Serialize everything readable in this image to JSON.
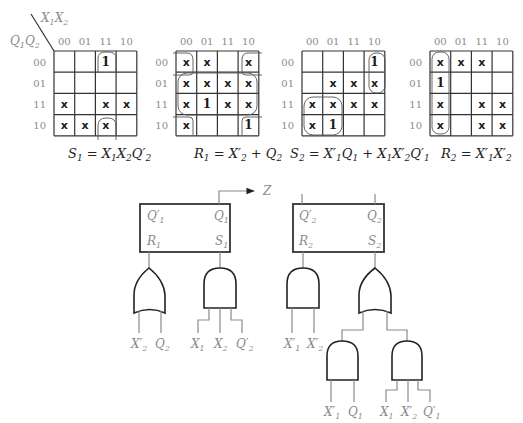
{
  "kmaps": [
    {
      "id": "S1",
      "corner_row_label": "Q1Q2",
      "corner_col_label": "X1X2",
      "col_headers": [
        "00",
        "01",
        "11",
        "10"
      ],
      "row_headers": [
        "00",
        "01",
        "11",
        "10"
      ],
      "cells": [
        [
          "",
          "",
          "1",
          ""
        ],
        [
          "",
          "",
          "",
          ""
        ],
        [
          "X",
          "",
          "X",
          "X"
        ],
        [
          "X",
          "X",
          "X",
          ""
        ]
      ],
      "equation": "S₁ = X₁X₂Q′₂"
    },
    {
      "id": "R1",
      "col_headers": [
        "00",
        "01",
        "11",
        "10"
      ],
      "row_headers": [
        "00",
        "01",
        "11",
        "10"
      ],
      "cells": [
        [
          "X",
          "X",
          "",
          "X"
        ],
        [
          "X",
          "X",
          "X",
          "X"
        ],
        [
          "X",
          "1",
          "X",
          "X"
        ],
        [
          "X",
          "",
          "",
          "1"
        ]
      ],
      "equation": "R₁ = X′₂ + Q₂"
    },
    {
      "id": "S2",
      "col_headers": [
        "00",
        "01",
        "11",
        "10"
      ],
      "row_headers": [
        "00",
        "01",
        "11",
        "10"
      ],
      "cells": [
        [
          "",
          "",
          "",
          "1"
        ],
        [
          "",
          "X",
          "X",
          "X"
        ],
        [
          "X",
          "X",
          "X",
          "X"
        ],
        [
          "X",
          "1",
          "",
          ""
        ]
      ],
      "equation": "S₂ = X′₁Q₁ + X₁X′₂Q′₁"
    },
    {
      "id": "R2",
      "col_headers": [
        "00",
        "01",
        "11",
        "10"
      ],
      "row_headers": [
        "00",
        "01",
        "11",
        "10"
      ],
      "cells": [
        [
          "X",
          "X",
          "X",
          ""
        ],
        [
          "1",
          "",
          "",
          ""
        ],
        [
          "X",
          "",
          "X",
          "X"
        ],
        [
          "X",
          "",
          "X",
          "X"
        ]
      ],
      "equation": "R₂ = X′₁X′₂"
    }
  ],
  "circuit": {
    "output_label": "Z",
    "flipflop1": {
      "q_bar": "Q′₁",
      "q": "Q₁",
      "r": "R₁",
      "s": "S₁"
    },
    "flipflop2": {
      "q_bar": "Q′₂",
      "q": "Q₂",
      "r": "R₂",
      "s": "S₂"
    },
    "or_gate_r1_inputs": [
      "X′₂",
      "Q₂"
    ],
    "and_gate_s1_inputs": [
      "X₁",
      "X₂",
      "Q′₂"
    ],
    "and_gate_r2_inputs": [
      "X′₁",
      "X′₂"
    ],
    "and_gate_s2a_inputs": [
      "X′₁",
      "Q₁"
    ],
    "and_gate_s2b_inputs": [
      "X₁",
      "X′₂",
      "Q′₁"
    ]
  }
}
